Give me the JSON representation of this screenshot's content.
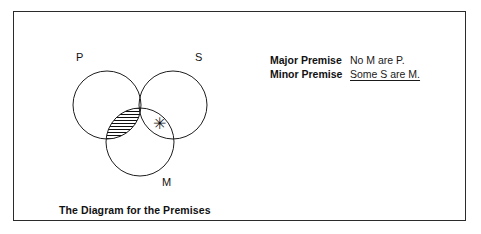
{
  "figure": {
    "caption": "The Diagram for the Premises",
    "border_color": "#2b2b2b",
    "background_color": "#ffffff"
  },
  "premises": {
    "rows": [
      {
        "label": "Major Premise",
        "text": "No M are P.",
        "underlined": false
      },
      {
        "label": "Minor Premise",
        "text": "Some S are M.",
        "underlined": true
      }
    ]
  },
  "venn": {
    "stroke_color": "#1d1d1d",
    "hatch_color": "#111111",
    "circles": [
      {
        "id": "P",
        "label": "P",
        "cx": 45,
        "cy": 61,
        "r": 34,
        "label_x": 14,
        "label_y": 17
      },
      {
        "id": "S",
        "label": "S",
        "cx": 111,
        "cy": 61,
        "r": 34,
        "label_x": 133,
        "label_y": 17
      },
      {
        "id": "M",
        "label": "M",
        "cx": 78,
        "cy": 98,
        "r": 34,
        "label_x": 100,
        "label_y": 142
      }
    ],
    "shaded_region": {
      "name": "P-and-M",
      "description": "P intersect M is shaded (hatched horizontal lines)",
      "pattern": "horizontal-hatch",
      "line_spacing_px": 3
    },
    "marked_region": {
      "name": "S-and-M-not-P",
      "symbol": "✳",
      "x": 97,
      "y": 80
    }
  }
}
